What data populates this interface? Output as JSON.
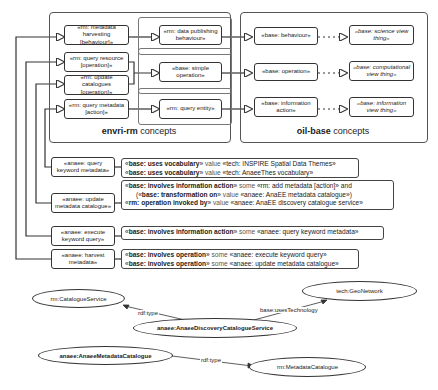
{
  "groups": {
    "envri_rm": {
      "label_bold": "envri-rm",
      "label_rest": " concepts"
    },
    "oil_base": {
      "label_bold": "oil-base",
      "label_rest": " concepts"
    }
  },
  "rm_boxes": {
    "metadata_harvesting": "«rm: metadata harvesting [behaviour]»",
    "data_publishing": "«rm: data publishing behaviour»",
    "query_resource": "«rm: query resource [operation]»",
    "update_catalogues": "«rm: update catalogues [operation]»",
    "simple_operation": "«base: simple operation»",
    "query_metadata": "«rm: query metadata [action]»",
    "query_entity": "«rm: query entity»"
  },
  "base_boxes": {
    "behaviour": "«base: behaviour»",
    "science_view_thing": "«base: science view thing»",
    "operation": "«base: operation»",
    "computational_view_thing": "«base: computational view thing»",
    "information_action": "«base: information action»",
    "information_view_thing": "«base: information view thing»"
  },
  "anaee_boxes": {
    "query_keyword_metadata": "«anaee: query keyword metadata»",
    "update_metadata_catalogue": "«anaee: update metadata catalogue»",
    "execute_keyword_query": "«anaee: execute keyword query»",
    "harvest_metadata": "«anaee: harvest metadata»"
  },
  "relations": {
    "r1": [
      {
        "pre": "«",
        "bold": "base: uses vocabulary",
        "post": "»",
        "kw": " value ",
        "rest": "«tech: INSPIRE Spatial Data Themes»"
      },
      {
        "pre": "«",
        "bold": "base: uses vocabulary",
        "post": "»",
        "kw": " value ",
        "rest": "«tech: AnaeeThes vocabulary»"
      }
    ],
    "r2": [
      {
        "pre": "«",
        "bold": "base: involves information action",
        "post": "»",
        "kw": " some ",
        "rest": "«rm: add metadata [action]» and"
      },
      {
        "pre": "      («",
        "bold": "base: transformation on",
        "post": "»",
        "kw": " value ",
        "rest": "«anaee: AnaEE metadata catalogue»)"
      },
      {
        "pre": "«",
        "bold": "rm: operation invoked by",
        "post": "»",
        "kw": " value ",
        "rest": "«anaee: AnaEE discovery catalogue service»"
      }
    ],
    "r3": [
      {
        "pre": "«",
        "bold": "base: involves information action",
        "post": "»",
        "kw": " some ",
        "rest": "«anaee: query keyword metadata»"
      }
    ],
    "r4": [
      {
        "pre": "«",
        "bold": "base: involves operation",
        "post": "»",
        "kw": " some ",
        "rest": "«anaee: execute keyword query»"
      },
      {
        "pre": "«",
        "bold": "base: involves operation",
        "post": "»",
        "kw": " some ",
        "rest": "«anaee: update metadata catalogue»"
      }
    ]
  },
  "rdf": {
    "catalogue_service": "rm:CatalogueService",
    "geonetwork": "tech:GeoNetwork",
    "discovery_service": "anaee:AnaeeDiscoveryCatalogueService",
    "metadata_catalogue_inst": "anaee:AnaeeMetadataCatalogue",
    "metadata_catalogue_class": "rm:MetadataCatalogue",
    "edge_rdf_type_1": "rdf:type",
    "edge_uses_technology": "base:usesTechnology",
    "edge_rdf_type_2": "rdf:type"
  }
}
